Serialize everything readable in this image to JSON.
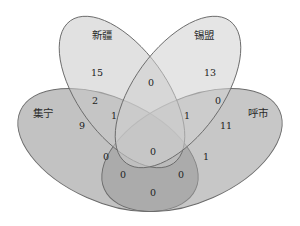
{
  "diagram": {
    "type": "venn-4",
    "sets": [
      {
        "key": "A",
        "label": "新疆",
        "fill": "#d8d8d8"
      },
      {
        "key": "B",
        "label": "锡盟",
        "fill": "#dcdcdc"
      },
      {
        "key": "C",
        "label": "集宁",
        "fill": "#9e9e9e"
      },
      {
        "key": "D",
        "label": "呼市",
        "fill": "#a8a8a8"
      }
    ],
    "regions": {
      "A_only": "15",
      "B_only": "13",
      "C_only": "9",
      "D_only": "11",
      "AB": "0",
      "AC": "2",
      "BD": "0",
      "AC_B": "1",
      "ABD": "1",
      "AD": "0",
      "BC": "0",
      "ABCD": "0",
      "ACD": "0",
      "BCD": "0",
      "CD": "0",
      "BD_only_lower": "1"
    },
    "stroke_color": "#6b6b6b",
    "background": "#ffffff"
  }
}
